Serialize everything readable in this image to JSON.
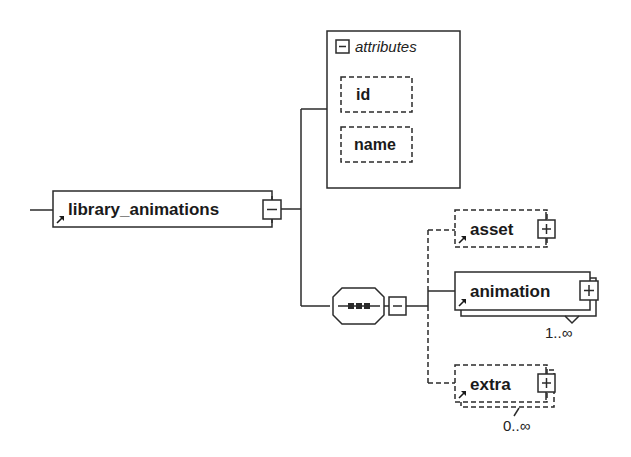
{
  "diagram": {
    "root": {
      "name": "library_animations",
      "expand_state": "collapse",
      "has_reference_arrow": true
    },
    "attributes_group": {
      "title": "attributes",
      "expand_state": "collapse",
      "items": [
        {
          "name": "id",
          "optional": true
        },
        {
          "name": "name",
          "optional": true
        }
      ]
    },
    "compositor": {
      "type": "sequence",
      "expand_state": "collapse"
    },
    "children": [
      {
        "name": "asset",
        "optional": true,
        "multiple": false,
        "cardinality": "",
        "expand_state": "expand"
      },
      {
        "name": "animation",
        "optional": false,
        "multiple": true,
        "cardinality": "1..∞",
        "expand_state": "expand"
      },
      {
        "name": "extra",
        "optional": true,
        "multiple": true,
        "cardinality": "0..∞",
        "expand_state": "expand"
      }
    ],
    "colors": {
      "line": "#2b2b2b",
      "background": "#ffffff",
      "text": "#1a1a1a"
    }
  }
}
